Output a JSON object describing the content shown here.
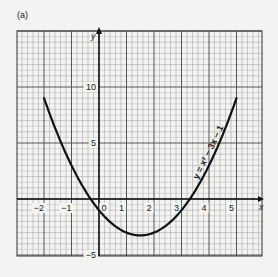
{
  "panel_label": "(a)",
  "chart_data": {
    "type": "line",
    "title": "",
    "equation_label": "y = x² − 3x − 1",
    "xlabel": "x",
    "ylabel": "y",
    "xlim": [
      -2.95,
      5.95
    ],
    "ylim": [
      -5.1,
      15.1
    ],
    "grid": true,
    "x_ticks": [
      {
        "value": -2,
        "label": "−2"
      },
      {
        "value": -1,
        "label": "−1"
      },
      {
        "value": 0,
        "label": "0"
      },
      {
        "value": 1,
        "label": "1"
      },
      {
        "value": 2,
        "label": "2"
      },
      {
        "value": 3,
        "label": "3"
      },
      {
        "value": 4,
        "label": "4"
      },
      {
        "value": 5,
        "label": "5"
      }
    ],
    "y_ticks": [
      {
        "value": 10,
        "label": "10"
      },
      {
        "value": 5,
        "label": "5"
      },
      {
        "value": -5,
        "label": "−5"
      }
    ],
    "series": [
      {
        "name": "y = x² − 3x − 1",
        "x": [
          -2,
          -1.5,
          -1,
          -0.5,
          0,
          0.5,
          1,
          1.5,
          2,
          2.5,
          3,
          3.5,
          4,
          4.5,
          5
        ],
        "y": [
          9,
          5.75,
          3,
          0.75,
          -1,
          -2.25,
          -3,
          -3.25,
          -3,
          -2.25,
          -1,
          0.75,
          3,
          5.75,
          9
        ]
      }
    ]
  }
}
